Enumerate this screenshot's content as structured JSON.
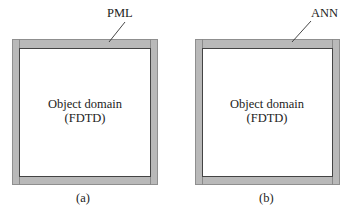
{
  "figure": {
    "panels": [
      {
        "id": "a",
        "caption": "(a)",
        "layer_label": "PML",
        "domain_line1": "Object domain",
        "domain_line2": "(FDTD)"
      },
      {
        "id": "b",
        "caption": "(b)",
        "layer_label": "ANN",
        "domain_line1": "Object domain",
        "domain_line2": "(FDTD)"
      }
    ],
    "colors": {
      "boundary_layer": "#b9b9b9",
      "domain_fill": "#ffffff",
      "outline": "#444444"
    }
  }
}
